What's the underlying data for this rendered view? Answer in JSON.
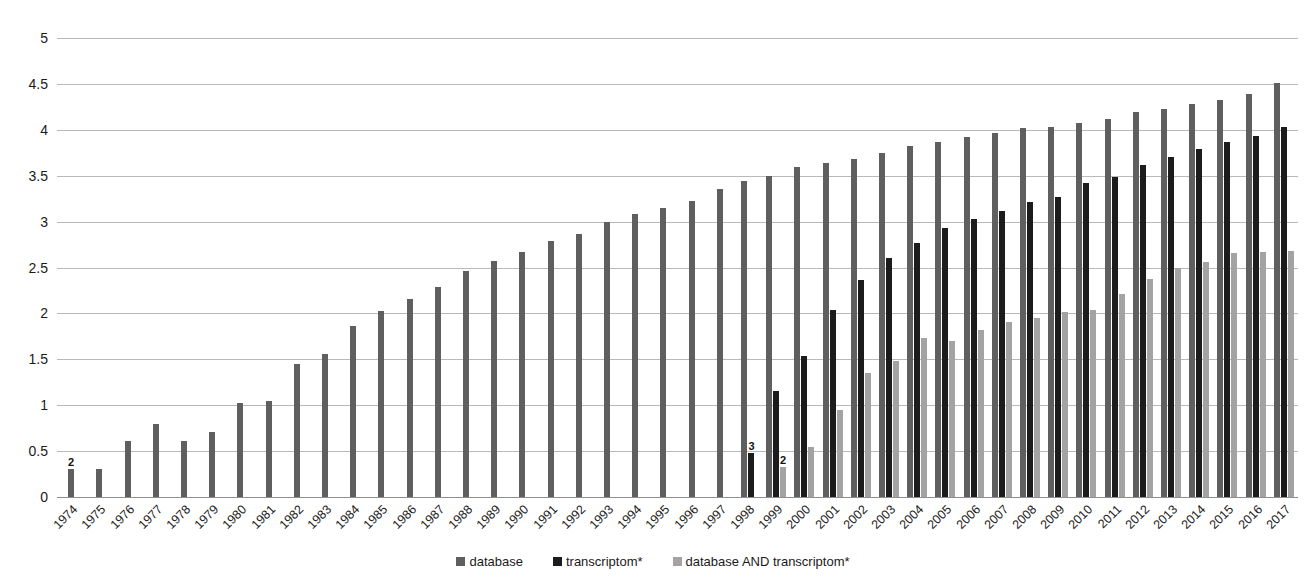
{
  "chart_data": {
    "type": "bar",
    "title": "",
    "subtitle": "",
    "xlabel": "",
    "ylabel": "",
    "ylim": [
      0,
      5
    ],
    "ytick_step": 0.5,
    "yticks": [
      "5",
      "4.5",
      "4",
      "3.5",
      "3",
      "2.5",
      "2",
      "1.5",
      "1",
      "0.5",
      "0"
    ],
    "grid": true,
    "legend_position": "bottom",
    "note": "Values are log10-style magnitudes of publication counts per year; bars grouped by year.",
    "categories": [
      "1974",
      "1975",
      "1976",
      "1977",
      "1978",
      "1979",
      "1980",
      "1981",
      "1982",
      "1983",
      "1984",
      "1985",
      "1986",
      "1987",
      "1988",
      "1989",
      "1990",
      "1991",
      "1992",
      "1993",
      "1994",
      "1995",
      "1996",
      "1997",
      "1998",
      "1999",
      "2000",
      "2001",
      "2002",
      "2003",
      "2004",
      "2005",
      "2006",
      "2007",
      "2008",
      "2009",
      "2010",
      "2011",
      "2012",
      "2013",
      "2014",
      "2015",
      "2016",
      "2017"
    ],
    "series": [
      {
        "name": "database",
        "color": "#5f5f5f",
        "values": [
          0.3,
          0.31,
          0.61,
          0.79,
          0.61,
          0.71,
          1.02,
          1.05,
          1.45,
          1.56,
          1.86,
          2.03,
          2.16,
          2.29,
          2.46,
          2.57,
          2.67,
          2.79,
          2.86,
          3.0,
          3.08,
          3.15,
          3.23,
          3.36,
          3.44,
          3.5,
          3.6,
          3.64,
          3.68,
          3.75,
          3.82,
          3.87,
          3.92,
          3.97,
          4.02,
          4.03,
          4.07,
          4.12,
          4.19,
          4.23,
          4.28,
          4.33,
          4.39,
          4.51
        ]
      },
      {
        "name": "transcriptom*",
        "color": "#1c1c1c",
        "values": [
          null,
          null,
          null,
          null,
          null,
          null,
          null,
          null,
          null,
          null,
          null,
          null,
          null,
          null,
          null,
          null,
          null,
          null,
          null,
          null,
          null,
          null,
          null,
          null,
          0.48,
          1.15,
          1.54,
          2.04,
          2.36,
          2.6,
          2.77,
          2.93,
          3.03,
          3.12,
          3.21,
          3.27,
          3.42,
          3.49,
          3.62,
          3.7,
          3.79,
          3.87,
          3.93,
          4.03
        ]
      },
      {
        "name": "database AND transcriptom*",
        "color": "#a3a3a3",
        "values": [
          null,
          null,
          null,
          null,
          null,
          null,
          null,
          null,
          null,
          null,
          null,
          null,
          null,
          null,
          null,
          null,
          null,
          null,
          null,
          null,
          null,
          null,
          null,
          null,
          null,
          0.33,
          0.54,
          0.95,
          1.35,
          1.48,
          1.73,
          1.7,
          1.82,
          1.91,
          1.95,
          2.01,
          2.04,
          2.21,
          2.37,
          2.5,
          2.56,
          2.66,
          2.67,
          2.68
        ]
      }
    ],
    "data_labels": [
      {
        "category": "1974",
        "series": "database",
        "text": "2"
      },
      {
        "category": "1998",
        "series": "transcriptom*",
        "text": "3"
      },
      {
        "category": "1999",
        "series": "database AND transcriptom*",
        "text": "2"
      }
    ],
    "legend": [
      {
        "label": "database",
        "color": "#5f5f5f"
      },
      {
        "label": "transcriptom*",
        "color": "#1c1c1c"
      },
      {
        "label": "database AND transcriptom*",
        "color": "#a3a3a3"
      }
    ]
  }
}
